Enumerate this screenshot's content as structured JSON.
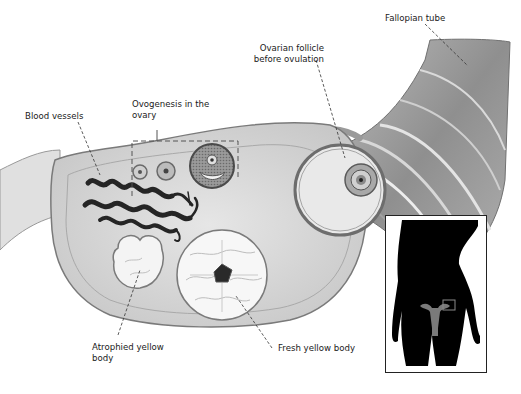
{
  "diagram": {
    "labels": {
      "fallopian_tube": "Fallopian tube",
      "ovarian_follicle_line1": "Ovarian follicle",
      "ovarian_follicle_line2": "before ovulation",
      "ovogenesis_line1": "Ovogenesis in the",
      "ovogenesis_line2": "ovary",
      "blood_vessels": "Blood vessels",
      "atrophied_line1": "Atrophied yellow",
      "atrophied_line2": "body",
      "fresh_yellow_body": "Fresh yellow body"
    },
    "inset": {
      "description": "Female body silhouette with uterus and ovary location highlighted"
    },
    "colors": {
      "background": "#ffffff",
      "tissue": "#d9d9d9",
      "tissue_dark": "#8a8a8a",
      "vessels": "#2a2a2a",
      "silhouette": "#000000",
      "organ_highlight": "#7a7a7a",
      "text": "#1a1a1a"
    }
  }
}
